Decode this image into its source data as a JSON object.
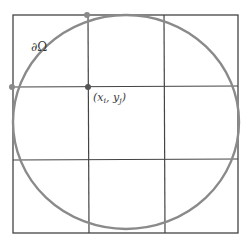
{
  "diagram": {
    "boundary_label": "∂Ω",
    "point_label": "(x",
    "point_label_i": "i",
    "point_label_sep": ", y",
    "point_label_j": "j",
    "point_label_close": ")",
    "colors": {
      "grid": "#444444",
      "circle": "#8a8a8a",
      "point_boundary": "#8a8a8a",
      "point_interior": "#555555"
    },
    "grid": {
      "columns": 3,
      "rows": 3
    }
  }
}
